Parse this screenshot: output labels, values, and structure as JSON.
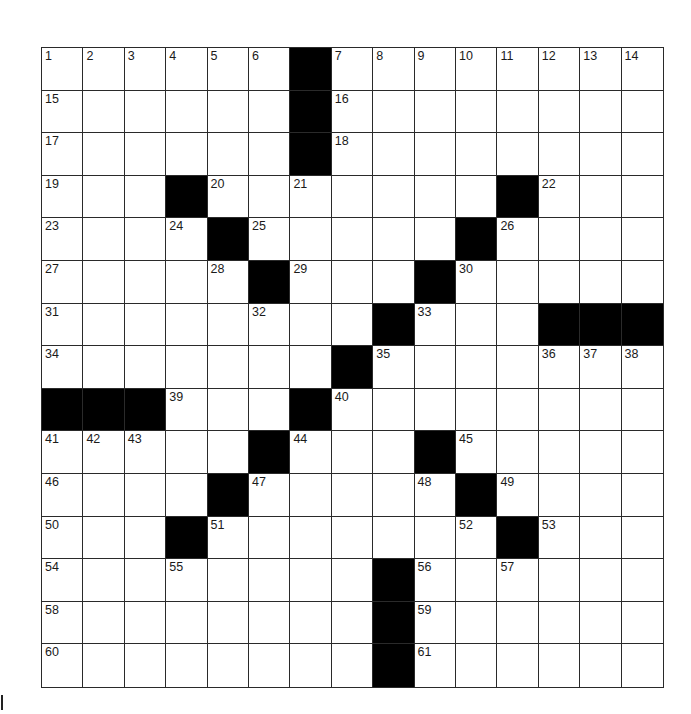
{
  "puzzle": {
    "rows": 15,
    "cols": 15,
    "colors": {
      "block": "#000000",
      "cell": "#ffffff",
      "line": "#2a2a2a",
      "number": "#1a1a1a"
    },
    "layout": [
      "......#........",
      "......#........",
      "......#........",
      "...#.......#...",
      "....#.....#....",
      ".....#...#.....",
      "........#...###",
      ".......#.......",
      "###...#........",
      ".....#...#.....",
      "....#.....#....",
      "...#.......#...",
      "........#......",
      "........#......",
      "........#......"
    ],
    "numbers": [
      {
        "r": 0,
        "c": 0,
        "n": "1"
      },
      {
        "r": 0,
        "c": 1,
        "n": "2"
      },
      {
        "r": 0,
        "c": 2,
        "n": "3"
      },
      {
        "r": 0,
        "c": 3,
        "n": "4"
      },
      {
        "r": 0,
        "c": 4,
        "n": "5"
      },
      {
        "r": 0,
        "c": 5,
        "n": "6"
      },
      {
        "r": 0,
        "c": 7,
        "n": "7"
      },
      {
        "r": 0,
        "c": 8,
        "n": "8"
      },
      {
        "r": 0,
        "c": 9,
        "n": "9"
      },
      {
        "r": 0,
        "c": 10,
        "n": "10"
      },
      {
        "r": 0,
        "c": 11,
        "n": "11"
      },
      {
        "r": 0,
        "c": 12,
        "n": "12"
      },
      {
        "r": 0,
        "c": 13,
        "n": "13"
      },
      {
        "r": 0,
        "c": 14,
        "n": "14"
      },
      {
        "r": 1,
        "c": 0,
        "n": "15"
      },
      {
        "r": 1,
        "c": 7,
        "n": "16"
      },
      {
        "r": 2,
        "c": 0,
        "n": "17"
      },
      {
        "r": 2,
        "c": 7,
        "n": "18"
      },
      {
        "r": 3,
        "c": 0,
        "n": "19"
      },
      {
        "r": 3,
        "c": 4,
        "n": "20"
      },
      {
        "r": 3,
        "c": 6,
        "n": "21"
      },
      {
        "r": 3,
        "c": 12,
        "n": "22"
      },
      {
        "r": 4,
        "c": 0,
        "n": "23"
      },
      {
        "r": 4,
        "c": 3,
        "n": "24"
      },
      {
        "r": 4,
        "c": 5,
        "n": "25"
      },
      {
        "r": 4,
        "c": 11,
        "n": "26"
      },
      {
        "r": 5,
        "c": 0,
        "n": "27"
      },
      {
        "r": 5,
        "c": 4,
        "n": "28"
      },
      {
        "r": 5,
        "c": 6,
        "n": "29"
      },
      {
        "r": 5,
        "c": 10,
        "n": "30"
      },
      {
        "r": 6,
        "c": 0,
        "n": "31"
      },
      {
        "r": 6,
        "c": 5,
        "n": "32"
      },
      {
        "r": 6,
        "c": 9,
        "n": "33"
      },
      {
        "r": 7,
        "c": 0,
        "n": "34"
      },
      {
        "r": 7,
        "c": 8,
        "n": "35"
      },
      {
        "r": 7,
        "c": 12,
        "n": "36"
      },
      {
        "r": 7,
        "c": 13,
        "n": "37"
      },
      {
        "r": 7,
        "c": 14,
        "n": "38"
      },
      {
        "r": 8,
        "c": 3,
        "n": "39"
      },
      {
        "r": 8,
        "c": 7,
        "n": "40"
      },
      {
        "r": 9,
        "c": 0,
        "n": "41"
      },
      {
        "r": 9,
        "c": 1,
        "n": "42"
      },
      {
        "r": 9,
        "c": 2,
        "n": "43"
      },
      {
        "r": 9,
        "c": 6,
        "n": "44"
      },
      {
        "r": 9,
        "c": 10,
        "n": "45"
      },
      {
        "r": 10,
        "c": 0,
        "n": "46"
      },
      {
        "r": 10,
        "c": 5,
        "n": "47"
      },
      {
        "r": 10,
        "c": 9,
        "n": "48"
      },
      {
        "r": 10,
        "c": 11,
        "n": "49"
      },
      {
        "r": 11,
        "c": 0,
        "n": "50"
      },
      {
        "r": 11,
        "c": 4,
        "n": "51"
      },
      {
        "r": 11,
        "c": 10,
        "n": "52"
      },
      {
        "r": 11,
        "c": 12,
        "n": "53"
      },
      {
        "r": 12,
        "c": 0,
        "n": "54"
      },
      {
        "r": 12,
        "c": 3,
        "n": "55"
      },
      {
        "r": 12,
        "c": 9,
        "n": "56"
      },
      {
        "r": 12,
        "c": 11,
        "n": "57"
      },
      {
        "r": 13,
        "c": 0,
        "n": "58"
      },
      {
        "r": 13,
        "c": 9,
        "n": "59"
      },
      {
        "r": 14,
        "c": 0,
        "n": "60"
      },
      {
        "r": 14,
        "c": 9,
        "n": "61"
      }
    ]
  }
}
